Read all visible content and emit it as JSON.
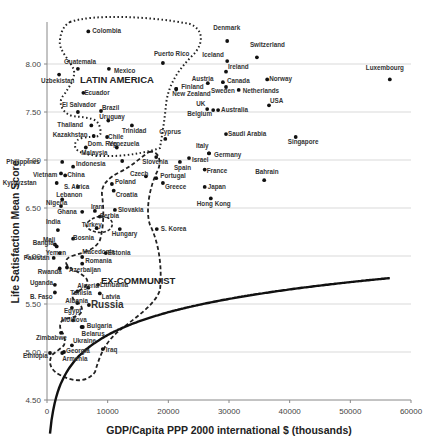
{
  "chart_data": {
    "type": "scatter",
    "title": "",
    "xlabel": "GDP/Capita PPP 2000 international $ (thousands)",
    "ylabel": "Life Satisfaction Mean Score",
    "xlim": [
      0,
      60000
    ],
    "ylim": [
      4.5,
      8.5
    ],
    "x_ticks": [
      0,
      10000,
      20000,
      30000,
      40000,
      50000,
      60000
    ],
    "y_ticks": [
      "4.50",
      "5.00",
      "5.50",
      "6.00",
      "6.50",
      "7.00",
      "7.50",
      "8.00"
    ],
    "grid": "horizontal",
    "annotations": [
      "LATIN AMERICA",
      "EX-COMMUNIST"
    ],
    "trendline": "logarithmic",
    "points": [
      {
        "name": "Colombia",
        "x": 6800,
        "y": 8.34
      },
      {
        "name": "Guatemala",
        "x": 5100,
        "y": 7.95
      },
      {
        "name": "Mexico",
        "x": 10200,
        "y": 7.95
      },
      {
        "name": "Uzbekistan",
        "x": 2000,
        "y": 7.89
      },
      {
        "name": "Ecuador",
        "x": 6000,
        "y": 7.7
      },
      {
        "name": "El Salvador",
        "x": 5100,
        "y": 7.5
      },
      {
        "name": "Brazil",
        "x": 8900,
        "y": 7.51
      },
      {
        "name": "Uruguay",
        "x": 10100,
        "y": 7.41
      },
      {
        "name": "Thailand",
        "x": 7300,
        "y": 7.36
      },
      {
        "name": "Kazakhstan",
        "x": 7700,
        "y": 7.25
      },
      {
        "name": "Chile",
        "x": 9900,
        "y": 7.24
      },
      {
        "name": "Dom. Rep.",
        "x": 6400,
        "y": 7.13
      },
      {
        "name": "Venezuela",
        "x": 11500,
        "y": 7.13
      },
      {
        "name": "Trinidad",
        "x": 14000,
        "y": 7.36
      },
      {
        "name": "Puerto Rico",
        "x": 19100,
        "y": 8.01
      },
      {
        "name": "Finland",
        "x": 21300,
        "y": 7.74
      },
      {
        "name": "New Zealand",
        "x": 21300,
        "y": 7.74
      },
      {
        "name": "Cyprus",
        "x": 19500,
        "y": 7.22
      },
      {
        "name": "Malaysia",
        "x": 12400,
        "y": 6.99
      },
      {
        "name": "Philippines",
        "x": 2500,
        "y": 6.98
      },
      {
        "name": "Indonesia",
        "x": 4300,
        "y": 6.93
      },
      {
        "name": "Vietnam",
        "x": 2300,
        "y": 6.86
      },
      {
        "name": "China",
        "x": 3000,
        "y": 6.84
      },
      {
        "name": "Kyrgyzstan",
        "x": 1600,
        "y": 6.76
      },
      {
        "name": "S. Africa",
        "x": 5100,
        "y": 6.72
      },
      {
        "name": "Poland",
        "x": 10700,
        "y": 6.75
      },
      {
        "name": "Croatia",
        "x": 11000,
        "y": 6.68
      },
      {
        "name": "Slovenia",
        "x": 18000,
        "y": 7.03
      },
      {
        "name": "Czech",
        "x": 16300,
        "y": 6.83
      },
      {
        "name": "Portugal",
        "x": 18000,
        "y": 6.81
      },
      {
        "name": "Greece",
        "x": 19100,
        "y": 6.76
      },
      {
        "name": "Spain",
        "x": 21900,
        "y": 6.98
      },
      {
        "name": "Israel",
        "x": 23400,
        "y": 7.02
      },
      {
        "name": "Italy",
        "x": 26700,
        "y": 7.07
      },
      {
        "name": "Germany",
        "x": 26700,
        "y": 7.07
      },
      {
        "name": "France",
        "x": 26000,
        "y": 6.9
      },
      {
        "name": "Japan",
        "x": 26000,
        "y": 6.72
      },
      {
        "name": "Hong Kong",
        "x": 27000,
        "y": 6.6
      },
      {
        "name": "Bahrain",
        "x": 35800,
        "y": 6.79
      },
      {
        "name": "Denmark",
        "x": 29700,
        "y": 8.24
      },
      {
        "name": "Switzerland",
        "x": 34600,
        "y": 8.07
      },
      {
        "name": "Iceland",
        "x": 29700,
        "y": 8.03
      },
      {
        "name": "Ireland",
        "x": 29500,
        "y": 7.92
      },
      {
        "name": "Austria",
        "x": 26500,
        "y": 7.8
      },
      {
        "name": "Canada",
        "x": 29000,
        "y": 7.81
      },
      {
        "name": "Sweden",
        "x": 29500,
        "y": 7.76
      },
      {
        "name": "Netherlands",
        "x": 31600,
        "y": 7.73
      },
      {
        "name": "Norway",
        "x": 36300,
        "y": 7.84
      },
      {
        "name": "UK",
        "x": 26400,
        "y": 7.53
      },
      {
        "name": "Belgium",
        "x": 27400,
        "y": 7.52
      },
      {
        "name": "Australia",
        "x": 28200,
        "y": 7.52
      },
      {
        "name": "USA",
        "x": 36600,
        "y": 7.57
      },
      {
        "name": "Saudi Arabia",
        "x": 29500,
        "y": 7.27
      },
      {
        "name": "Singapore",
        "x": 41000,
        "y": 7.24
      },
      {
        "name": "Luxembourg",
        "x": 56500,
        "y": 7.84
      },
      {
        "name": "Lebanon",
        "x": 2500,
        "y": 6.59
      },
      {
        "name": "Nigeria",
        "x": 2300,
        "y": 6.52
      },
      {
        "name": "Ghana",
        "x": 5800,
        "y": 6.46
      },
      {
        "name": "Iran",
        "x": 7900,
        "y": 6.47
      },
      {
        "name": "Serbia",
        "x": 8700,
        "y": 6.41
      },
      {
        "name": "Slovakia",
        "x": 11200,
        "y": 6.48
      },
      {
        "name": "Turkey",
        "x": 8200,
        "y": 6.29
      },
      {
        "name": "Bosnia",
        "x": 4300,
        "y": 6.18
      },
      {
        "name": "Hungary",
        "x": 12000,
        "y": 6.28
      },
      {
        "name": "S. Korea",
        "x": 18100,
        "y": 6.28
      },
      {
        "name": "India",
        "x": 1800,
        "y": 6.27
      },
      {
        "name": "Mali",
        "x": 1300,
        "y": 6.12
      },
      {
        "name": "Bangla.",
        "x": 1600,
        "y": 6.1
      },
      {
        "name": "Yemen",
        "x": 2100,
        "y": 6.03
      },
      {
        "name": "Pakistan",
        "x": 1100,
        "y": 5.98
      },
      {
        "name": "Rwanda",
        "x": 2100,
        "y": 5.87
      },
      {
        "name": "Macedonia",
        "x": 5800,
        "y": 5.99
      },
      {
        "name": "Estonia",
        "x": 9700,
        "y": 6.03
      },
      {
        "name": "Romania",
        "x": 5800,
        "y": 5.92
      },
      {
        "name": "Azerbaijan",
        "x": 3300,
        "y": 5.88
      },
      {
        "name": "Lithuania",
        "x": 8400,
        "y": 5.7
      },
      {
        "name": "Algeria",
        "x": 6800,
        "y": 5.67
      },
      {
        "name": "Latvia",
        "x": 8700,
        "y": 5.61
      },
      {
        "name": "Tunisia",
        "x": 5000,
        "y": 5.63
      },
      {
        "name": "Uganda",
        "x": 1300,
        "y": 5.7
      },
      {
        "name": "B. Faso",
        "x": 1300,
        "y": 5.62
      },
      {
        "name": "Russia",
        "x": 6900,
        "y": 5.49
      },
      {
        "name": "Albania",
        "x": 5000,
        "y": 5.51
      },
      {
        "name": "Egypt",
        "x": 4100,
        "y": 5.46
      },
      {
        "name": "Moldova",
        "x": 4300,
        "y": 5.33
      },
      {
        "name": "Bulgaria",
        "x": 5900,
        "y": 5.26
      },
      {
        "name": "Belarus",
        "x": 5700,
        "y": 5.26
      },
      {
        "name": "Zimbabwe",
        "x": 2300,
        "y": 5.2
      },
      {
        "name": "Ukraine",
        "x": 4100,
        "y": 5.07
      },
      {
        "name": "Georgia",
        "x": 2800,
        "y": 5.0
      },
      {
        "name": "Armenia",
        "x": 2500,
        "y": 4.99
      },
      {
        "name": "Iraq",
        "x": 9200,
        "y": 5.03
      },
      {
        "name": "Ethiopia",
        "x": 500,
        "y": 4.99
      }
    ]
  },
  "labels": {
    "region_latin": "LATIN AMERICA",
    "region_excommunist": "EX-COMMUNIST"
  }
}
